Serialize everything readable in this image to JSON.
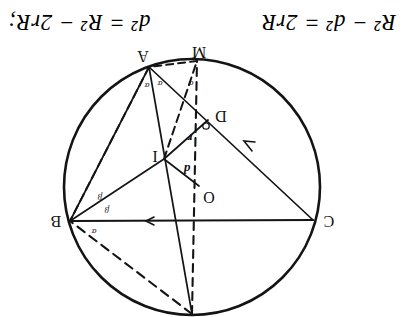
{
  "figure": {
    "name": "euler-triangle-incircle-circumcircle",
    "orientation": "rotated-180",
    "circle": {
      "cx": 212,
      "cy": 130,
      "r": 128
    },
    "points": [
      {
        "id": "N",
        "label": "",
        "x": 212,
        "y": 3,
        "label_dx": 0,
        "label_dy": 0
      },
      {
        "id": "B",
        "label": "B",
        "x": 334,
        "y": 96,
        "label_dx": 14,
        "label_dy": 5
      },
      {
        "id": "C",
        "label": "C",
        "x": 91,
        "y": 97,
        "label_dx": -16,
        "label_dy": 4
      },
      {
        "id": "O",
        "label": "O",
        "x": 205,
        "y": 131,
        "label_dx": -10,
        "label_dy": -6
      },
      {
        "id": "I",
        "label": "I",
        "x": 240,
        "y": 158,
        "label_dx": 9,
        "label_dy": 8
      },
      {
        "id": "D",
        "label": "D",
        "x": 196,
        "y": 197,
        "label_dx": -13,
        "label_dy": 9
      },
      {
        "id": "M",
        "label": "M",
        "x": 207,
        "y": 256,
        "label_dx": -2,
        "label_dy": 14
      },
      {
        "id": "A",
        "label": "A",
        "x": 255,
        "y": 250,
        "label_dx": 6,
        "label_dy": 16
      }
    ],
    "solid_segments": [
      {
        "name": "chord-CB",
        "from": "C",
        "to": "B"
      },
      {
        "name": "chord-CA",
        "from": "C",
        "to": "A"
      },
      {
        "name": "chord-NA",
        "from": "N",
        "to": "A"
      },
      {
        "name": "chord-AB",
        "from": "A",
        "to": "B"
      },
      {
        "name": "radius-OI",
        "from": "O",
        "to": "I"
      },
      {
        "name": "segment-IB",
        "from": "I",
        "to": "B"
      },
      {
        "name": "segment-ID",
        "from": "I",
        "to": "D"
      }
    ],
    "dashed_segments": [
      {
        "name": "chord-NB",
        "from": "N",
        "to": "B"
      },
      {
        "name": "diameter-NM",
        "from": "N",
        "to": "M"
      },
      {
        "name": "segment-MA",
        "from": "M",
        "to": "A"
      },
      {
        "name": "segment-IA",
        "from": "I",
        "to": "A"
      },
      {
        "name": "segment-AB-dashed",
        "from": "A",
        "to": "B"
      }
    ],
    "segment_labels": [
      {
        "name": "label-d",
        "text": "d",
        "x": 217,
        "y": 152
      },
      {
        "name": "label-r",
        "text": "r",
        "x": 214,
        "y": 183
      }
    ],
    "angle_labels": [
      {
        "name": "angle-alpha-at-B-upper",
        "text": "α",
        "x": 310,
        "y": 88
      },
      {
        "name": "angle-beta-at-B-upper",
        "text": "β",
        "x": 297,
        "y": 110
      },
      {
        "name": "angle-beta-at-B-lower",
        "text": "β",
        "x": 304,
        "y": 123
      },
      {
        "name": "angle-alpha-at-A-left",
        "text": "α",
        "x": 244,
        "y": 236
      },
      {
        "name": "angle-alpha-at-A-right",
        "text": "α",
        "x": 257,
        "y": 234
      },
      {
        "name": "angle-alpha-at-M",
        "text": "α",
        "x": 213,
        "y": 236
      }
    ],
    "right_angle_mark": {
      "name": "right-angle-at-D",
      "x": 198,
      "y": 191
    },
    "tick_marks": [
      {
        "name": "tick-on-CB",
        "x": 256,
        "y": 96,
        "angle": 0
      },
      {
        "name": "tick-on-CA",
        "x": 158,
        "y": 175,
        "angle": 48
      }
    ]
  },
  "caption": {
    "formula_right": "d² = R² − 2rR;",
    "formula_left": "R² − d² = 2rR"
  }
}
